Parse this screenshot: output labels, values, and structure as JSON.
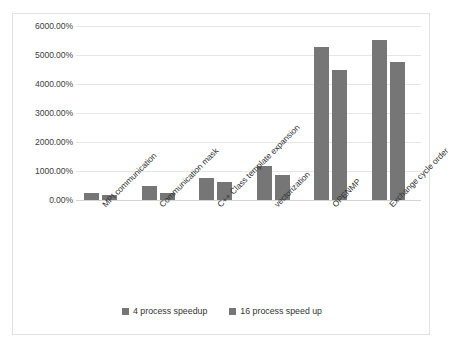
{
  "chart_data": {
    "type": "bar",
    "title": "",
    "subtitle": "",
    "xlabel": "",
    "ylabel": "",
    "ylim": [
      0,
      6000
    ],
    "ytick_step": 1000,
    "ytick_labels": [
      "6000.00%",
      "5000.00%",
      "4000.00%",
      "3000.00%",
      "2000.00%",
      "1000.00%",
      "0.00%"
    ],
    "ytick_values": [
      6000,
      5000,
      4000,
      3000,
      2000,
      1000,
      0
    ],
    "grid": true,
    "legend_position": "bottom",
    "value_unit": "%",
    "bar_color": "#767676",
    "categories": [
      "MPI communication",
      "Communication mask",
      "C++ Class template expansion",
      "vectorization",
      "OPENMP",
      "Exchange cycle order"
    ],
    "series": [
      {
        "name": "4 process speedup",
        "color": "#767676",
        "values": [
          230,
          490,
          760,
          1160,
          5270,
          5520
        ]
      },
      {
        "name": "16 process speed up",
        "color": "#767676",
        "values": [
          160,
          230,
          620,
          870,
          4490,
          4760
        ]
      }
    ]
  }
}
